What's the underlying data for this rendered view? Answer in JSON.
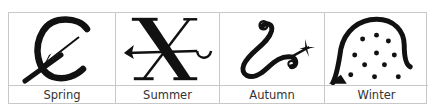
{
  "table": {
    "columns": [
      {
        "label": "Spring",
        "symbol": "spring-symbol-icon"
      },
      {
        "label": "Summer",
        "symbol": "summer-symbol-icon"
      },
      {
        "label": "Autumn",
        "symbol": "autumn-symbol-icon"
      },
      {
        "label": "Winter",
        "symbol": "winter-symbol-icon"
      }
    ]
  },
  "colors": {
    "ink": "#111111",
    "grid": "#c8c8c8",
    "label": "#333333"
  }
}
